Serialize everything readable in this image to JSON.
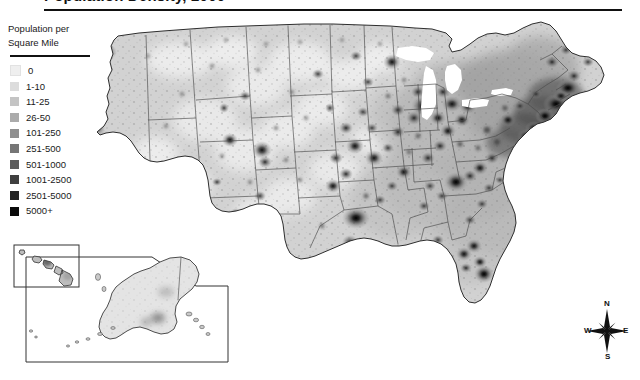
{
  "title": "Population Density, 2000",
  "legend": {
    "heading_line1": "Population per",
    "heading_line2": "Square Mile",
    "entries": [
      {
        "label": "0",
        "color": "#efefef"
      },
      {
        "label": "1-10",
        "color": "#dcdcdc"
      },
      {
        "label": "11-25",
        "color": "#c4c4c4"
      },
      {
        "label": "26-50",
        "color": "#ababab"
      },
      {
        "label": "101-250",
        "color": "#8f8f8f"
      },
      {
        "label": "251-500",
        "color": "#767676"
      },
      {
        "label": "501-1000",
        "color": "#5c5c5c"
      },
      {
        "label": "1001-2500",
        "color": "#3f3f3f"
      },
      {
        "label": "2501-5000",
        "color": "#232323"
      },
      {
        "label": "5000+",
        "color": "#0a0a0a"
      }
    ]
  },
  "compass": {
    "north": "N",
    "south": "S",
    "east": "E",
    "west": "W"
  },
  "map": {
    "name": "united-states-population-density-choropleth",
    "regions": [
      {
        "name": "contiguous-united-states"
      },
      {
        "name": "alaska-inset"
      },
      {
        "name": "hawaii-inset"
      }
    ],
    "water_color": "#ffffff",
    "boundary_color": "#3a3a3a",
    "background_color": "#ffffff"
  }
}
